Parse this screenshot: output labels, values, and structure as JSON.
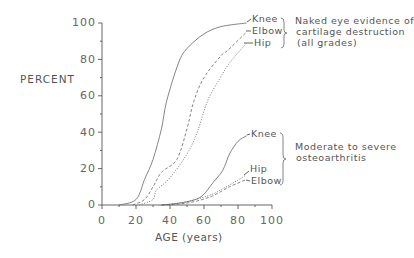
{
  "chart_data": {
    "type": "line",
    "title": "",
    "xlabel": "AGE (years)",
    "ylabel": "PERCENT",
    "xlim": [
      0,
      100
    ],
    "ylim": [
      0,
      100
    ],
    "x_ticks": [
      0,
      20,
      40,
      60,
      80,
      100
    ],
    "y_ticks": [
      0,
      20,
      40,
      60,
      80,
      100
    ],
    "grid": false,
    "groups": [
      {
        "label": "Naked eye evidence of cartilage destruction (all grades)",
        "label_lines": [
          "Naked eye evidence of",
          "cartilage destruction",
          "(all grades)"
        ],
        "series": [
          {
            "name": "Knee",
            "style": "solid",
            "points": [
              [
                10,
                0
              ],
              [
                20,
                3
              ],
              [
                25,
                14
              ],
              [
                30,
                25
              ],
              [
                35,
                42
              ],
              [
                38,
                57
              ],
              [
                45,
                78
              ],
              [
                50,
                86
              ],
              [
                60,
                94
              ],
              [
                70,
                98
              ],
              [
                85,
                100
              ]
            ]
          },
          {
            "name": "Elbow",
            "style": "dashed",
            "points": [
              [
                18,
                0
              ],
              [
                25,
                3
              ],
              [
                30,
                10
              ],
              [
                35,
                18
              ],
              [
                44,
                25
              ],
              [
                50,
                42
              ],
              [
                54,
                57
              ],
              [
                60,
                70
              ],
              [
                70,
                82
              ],
              [
                74,
                85
              ],
              [
                85,
                95
              ]
            ]
          },
          {
            "name": "Hip",
            "style": "dotted",
            "points": [
              [
                22,
                0
              ],
              [
                30,
                3
              ],
              [
                32,
                8
              ],
              [
                40,
                15
              ],
              [
                50,
                28
              ],
              [
                56,
                40
              ],
              [
                62,
                57
              ],
              [
                69,
                69
              ],
              [
                75,
                78
              ],
              [
                85,
                89
              ]
            ]
          }
        ]
      },
      {
        "label": "Moderate to severe osteoarthritis",
        "label_lines": [
          "Moderate to severe",
          "osteoarthritis"
        ],
        "series": [
          {
            "name": "Knee",
            "style": "solid",
            "points": [
              [
                35,
                0
              ],
              [
                45,
                1
              ],
              [
                55,
                3
              ],
              [
                60,
                6
              ],
              [
                65,
                12
              ],
              [
                71,
                19
              ],
              [
                75,
                28
              ],
              [
                80,
                35
              ],
              [
                85,
                38
              ]
            ]
          },
          {
            "name": "Hip",
            "style": "dotted",
            "points": [
              [
                35,
                0
              ],
              [
                45,
                1
              ],
              [
                55,
                3
              ],
              [
                65,
                6
              ],
              [
                75,
                11
              ],
              [
                84,
                16
              ]
            ]
          },
          {
            "name": "Elbow",
            "style": "dashed",
            "points": [
              [
                35,
                0
              ],
              [
                45,
                0.5
              ],
              [
                55,
                2
              ],
              [
                65,
                5
              ],
              [
                75,
                10
              ],
              [
                85,
                14
              ]
            ]
          }
        ]
      }
    ]
  },
  "labels": {
    "ylabel": "PERCENT",
    "xlabel": "AGE (years)",
    "y_ticks": [
      "100",
      "80",
      "60",
      "40",
      "20",
      "0"
    ],
    "x_ticks": [
      "0",
      "20",
      "40",
      "60",
      "80",
      "100"
    ],
    "upper": {
      "knee": "Knee",
      "elbow": "Elbow",
      "hip": "Hip",
      "line1": "Naked eye evidence of",
      "line2": "cartilage destruction",
      "line3": "(all grades)"
    },
    "lower": {
      "knee": "Knee",
      "hip": "Hip",
      "elbow": "Elbow",
      "line1": "Moderate to severe",
      "line2": "osteoarthritis"
    }
  },
  "colors": {
    "line": "#666666",
    "axis": "#555555",
    "text": "#555555"
  }
}
